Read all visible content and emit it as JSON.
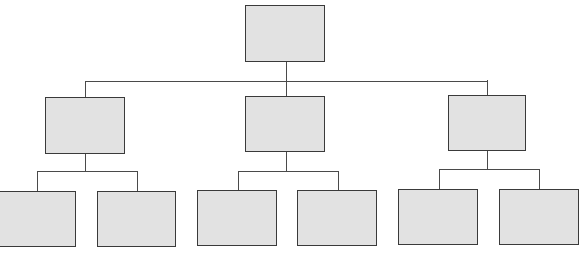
{
  "diagram": {
    "type": "org-chart",
    "levels": 3,
    "colors": {
      "node_fill": "#e2e2e2",
      "node_border": "#3a3a3a",
      "connector": "#4a4a4a"
    },
    "root": {
      "label": ""
    },
    "level2": [
      {
        "label": "",
        "children": [
          {
            "label": ""
          },
          {
            "label": ""
          }
        ]
      },
      {
        "label": "",
        "children": [
          {
            "label": ""
          },
          {
            "label": ""
          }
        ]
      },
      {
        "label": "",
        "children": [
          {
            "label": ""
          },
          {
            "label": ""
          }
        ]
      }
    ]
  }
}
